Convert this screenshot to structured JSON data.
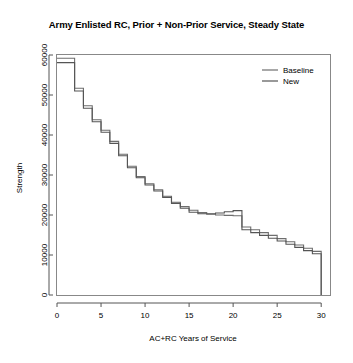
{
  "chart_data": {
    "type": "line",
    "title": "Army Enlisted RC, Prior + Non-Prior Service, Steady State",
    "xlabel": "AC+RC Years of Service",
    "ylabel": "Strength",
    "xlim": [
      0,
      31
    ],
    "ylim": [
      0,
      60000
    ],
    "xticks": [
      0,
      5,
      10,
      15,
      20,
      25,
      30
    ],
    "xtick_labels": [
      "0",
      "5",
      "10",
      "15",
      "20",
      "25",
      "30"
    ],
    "yticks": [
      0,
      10000,
      20000,
      30000,
      40000,
      50000,
      60000
    ],
    "ytick_labels": [
      "0",
      "10000",
      "20000",
      "30000",
      "40000",
      "50000",
      "60000"
    ],
    "grid": false,
    "legend_position": "top-right",
    "drawstyle": "steps-post",
    "series": [
      {
        "name": "Baseline",
        "color": "#6e6e6e",
        "x": [
          0,
          1,
          2,
          3,
          4,
          5,
          6,
          7,
          8,
          9,
          10,
          11,
          12,
          13,
          14,
          15,
          16,
          17,
          18,
          19,
          20,
          21,
          22,
          23,
          24,
          25,
          26,
          27,
          28,
          29,
          30,
          30
        ],
        "values": [
          59200,
          59200,
          51700,
          47300,
          43800,
          41200,
          38400,
          35200,
          32200,
          29600,
          27800,
          26300,
          24700,
          23200,
          22100,
          21200,
          20600,
          20200,
          20000,
          19900,
          19800,
          17000,
          16300,
          15600,
          14900,
          14100,
          13300,
          12500,
          11700,
          10900,
          8200,
          0
        ]
      },
      {
        "name": "New",
        "color": "#555555",
        "x": [
          0,
          1,
          2,
          3,
          4,
          5,
          6,
          7,
          8,
          9,
          10,
          11,
          12,
          13,
          14,
          15,
          16,
          17,
          18,
          19,
          20,
          21,
          22,
          23,
          24,
          25,
          26,
          27,
          28,
          29,
          30,
          30
        ],
        "values": [
          58100,
          58100,
          51000,
          46700,
          43300,
          40700,
          37900,
          34800,
          31800,
          29300,
          27500,
          26000,
          24400,
          22900,
          21700,
          20700,
          20300,
          20300,
          20500,
          20800,
          21100,
          16300,
          15600,
          14900,
          14200,
          13500,
          12700,
          11900,
          11100,
          10300,
          7700,
          0
        ]
      }
    ]
  },
  "legend": {
    "entries": [
      {
        "label": "Baseline"
      },
      {
        "label": "New"
      }
    ]
  }
}
